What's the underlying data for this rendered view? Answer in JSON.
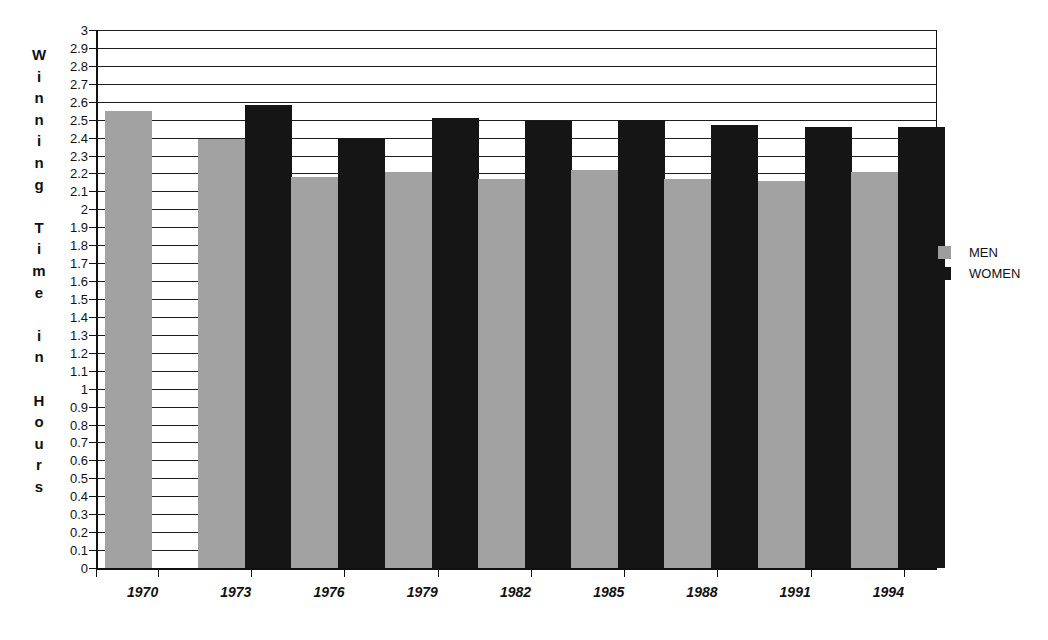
{
  "chart_data": {
    "type": "bar",
    "title": "",
    "xlabel": "",
    "ylabel": "Winning Time in Hours",
    "ylim": [
      0,
      3
    ],
    "ytick_step": 0.1,
    "grid": true,
    "legend_position": "right",
    "categories": [
      "1970",
      "1973",
      "1976",
      "1979",
      "1982",
      "1985",
      "1988",
      "1991",
      "1994"
    ],
    "series": [
      {
        "name": "MEN",
        "color": "#a2a2a2",
        "values": [
          2.55,
          2.39,
          2.18,
          2.21,
          2.17,
          2.22,
          2.17,
          2.16,
          2.21
        ]
      },
      {
        "name": "WOMEN",
        "color": "#151515",
        "values": [
          null,
          2.58,
          2.4,
          2.51,
          2.49,
          2.5,
          2.47,
          2.46,
          2.46
        ]
      }
    ],
    "ytick_labels": [
      "0",
      "0.1",
      "0.2",
      "0.3",
      "0.4",
      "0.5",
      "0.6",
      "0.7",
      "0.8",
      "0.9",
      "1",
      "1.1",
      "1.2",
      "1.3",
      "1.4",
      "1.5",
      "1.6",
      "1.7",
      "1.8",
      "1.9",
      "2",
      "2.1",
      "2.2",
      "2.3",
      "2.4",
      "2.5",
      "2.6",
      "2.7",
      "2.8",
      "2.9",
      "3"
    ]
  },
  "yaxis": {
    "title_letters": [
      "W",
      "i",
      "n",
      "n",
      "i",
      "n",
      "g",
      "",
      "T",
      "i",
      "m",
      "e",
      "",
      "i",
      "n",
      "",
      "H",
      "o",
      "u",
      "r",
      "s"
    ]
  },
  "legend": {
    "items": [
      {
        "label": "MEN",
        "color": "#a2a2a2"
      },
      {
        "label": "WOMEN",
        "color": "#151515"
      }
    ]
  }
}
